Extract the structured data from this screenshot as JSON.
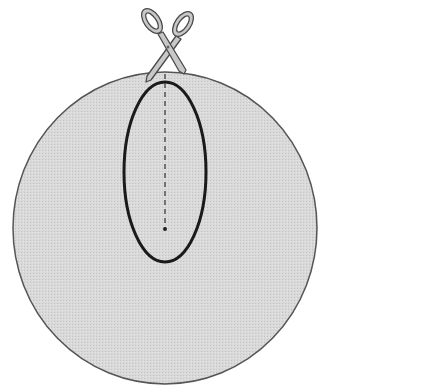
{
  "diagram": {
    "colors": {
      "background": "#ffffff",
      "circle_fill": "#d9d9d9",
      "circle_stroke": "#555555",
      "ellipse_stroke": "#1a1a1a",
      "dashed_line": "#333333",
      "scissors_fill": "#c8c8c8",
      "scissors_stroke": "#4a4a4a"
    },
    "shapes": {
      "circle": {
        "cx": 165,
        "cy": 228,
        "rx": 152,
        "ry": 156
      },
      "ellipse": {
        "cx": 165,
        "cy": 172,
        "rx": 41,
        "ry": 90
      },
      "cut_line": {
        "x": 165,
        "y1": 74,
        "y2": 229,
        "style": "dashed"
      },
      "cut_end_dot": {
        "cx": 165,
        "cy": 229,
        "r": 2
      }
    },
    "icons": {
      "scissors": "scissors-icon"
    }
  }
}
